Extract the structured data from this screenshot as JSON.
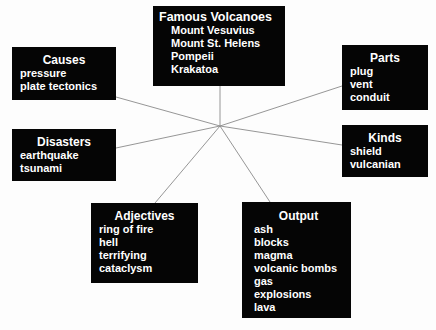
{
  "diagram": {
    "type": "concept-map",
    "hub": {
      "x": 220,
      "y": 126
    },
    "line_color": "#8a8a8a",
    "node_color": "#050505",
    "text_color": "#ffffff",
    "nodes": {
      "famous": {
        "title": "Famous Volcanoes",
        "items": [
          "Mount Vesuvius",
          "Mount St. Helens",
          "Pompeii",
          "Krakatoa"
        ]
      },
      "causes": {
        "title": "Causes",
        "items": [
          "pressure",
          "plate tectonics"
        ]
      },
      "disasters": {
        "title": "Disasters",
        "items": [
          "earthquake",
          "tsunami"
        ]
      },
      "parts": {
        "title": "Parts",
        "items": [
          "plug",
          "vent",
          "conduit"
        ]
      },
      "kinds": {
        "title": "Kinds",
        "items": [
          "shield",
          "vulcanian"
        ]
      },
      "adjectives": {
        "title": "Adjectives",
        "items": [
          "ring of fire",
          "hell",
          "terrifying",
          "cataclysm"
        ]
      },
      "output": {
        "title": "Output",
        "items": [
          "ash",
          "blocks",
          "magma",
          "volcanic bombs",
          "gas",
          "explosions",
          "lava"
        ]
      }
    },
    "edges": [
      {
        "to": "famous",
        "x": 220,
        "y": 86
      },
      {
        "to": "causes",
        "x": 116,
        "y": 97
      },
      {
        "to": "disasters",
        "x": 116,
        "y": 148
      },
      {
        "to": "parts",
        "x": 342,
        "y": 86
      },
      {
        "to": "kinds",
        "x": 342,
        "y": 145
      },
      {
        "to": "adjectives",
        "x": 155,
        "y": 203
      },
      {
        "to": "output",
        "x": 270,
        "y": 202
      }
    ]
  }
}
